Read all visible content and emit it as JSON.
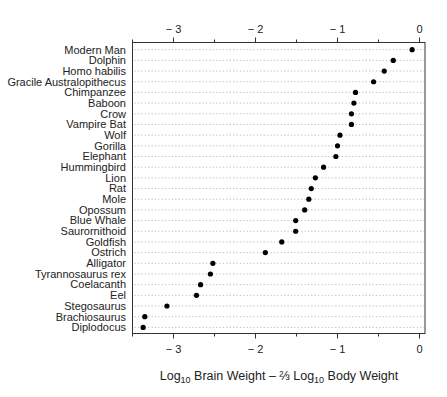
{
  "chart_data": {
    "type": "dotplot",
    "title": "",
    "xlabel": "Log10 Brain Weight – 2/3 Log10 Body Weight",
    "xlabel_parts": {
      "p1": "Log",
      "sub1": "10",
      "p2": " Brain Weight – ",
      "frac": "⅔",
      "p3": " Log",
      "sub2": "10",
      "p4": " Body Weight"
    },
    "ylabel": "",
    "xlim": [
      -3.5,
      0.07
    ],
    "major_ticks": [
      -3,
      -2,
      -1,
      0
    ],
    "major_tick_labels": [
      "− 3",
      "− 2",
      "− 1",
      "0"
    ],
    "minor_ticks": [
      -3.5,
      -2.5,
      -1.5,
      -0.5
    ],
    "axes": [
      "top",
      "bottom"
    ],
    "grid": "dotted horizontal lines per row",
    "categories": [
      "Modern Man",
      "Dolphin",
      "Homo habilis",
      "Gracile Australopithecus",
      "Chimpanzee",
      "Baboon",
      "Crow",
      "Vampire Bat",
      "Wolf",
      "Gorilla",
      "Elephant",
      "Hummingbird",
      "Lion",
      "Rat",
      "Mole",
      "Opossum",
      "Blue Whale",
      "Saurornithoid",
      "Goldfish",
      "Ostrich",
      "Alligator",
      "Tyrannosaurus rex",
      "Coelacanth",
      "Eel",
      "Stegosaurus",
      "Brachiosaurus",
      "Diplodocus"
    ],
    "values": [
      -0.09,
      -0.32,
      -0.43,
      -0.56,
      -0.78,
      -0.8,
      -0.83,
      -0.83,
      -0.97,
      -1.0,
      -1.02,
      -1.17,
      -1.27,
      -1.32,
      -1.35,
      -1.4,
      -1.51,
      -1.51,
      -1.68,
      -1.88,
      -2.52,
      -2.55,
      -2.67,
      -2.72,
      -3.08,
      -3.35,
      -3.37
    ]
  }
}
